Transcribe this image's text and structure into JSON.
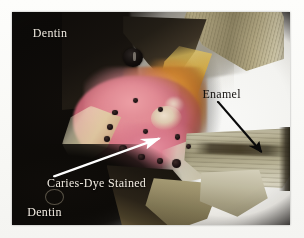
{
  "figure": {
    "kind": "dental-histology-micrograph"
  },
  "labels": {
    "dentin": "Dentin",
    "caries_line1": "Caries-Dye Stained",
    "caries_line2": "Dentin",
    "enamel": "Enamel"
  },
  "annotations": {
    "white_arrow": {
      "name": "caries-dye-stained-dentin-arrow",
      "color": "#ffffff",
      "points_to": "pink stained dentin"
    },
    "black_arrow": {
      "name": "enamel-arrow",
      "color": "#000000",
      "points_to": "enamel slab"
    }
  },
  "colors": {
    "background": "#ffffff",
    "dark_dentin": "#0d0a08",
    "stained_dentin_pink": "#e2858f",
    "carious_amber": "#c4762a",
    "enamel_olive": "#a89d79",
    "enamel_pale": "#cfcab2",
    "label_light": "#f2ece2",
    "label_dark": "#14110e"
  },
  "indent_marks": [
    {
      "x": 36.0,
      "y": 46.0,
      "d": 2.0
    },
    {
      "x": 34.0,
      "y": 52.5,
      "d": 2.4
    },
    {
      "x": 33.0,
      "y": 58.0,
      "d": 2.2
    },
    {
      "x": 38.5,
      "y": 62.5,
      "d": 3.0
    },
    {
      "x": 45.5,
      "y": 66.5,
      "d": 2.2
    },
    {
      "x": 52.0,
      "y": 68.5,
      "d": 2.4
    },
    {
      "x": 57.5,
      "y": 69.0,
      "d": 3.4
    },
    {
      "x": 52.5,
      "y": 44.5,
      "d": 2.0
    },
    {
      "x": 58.5,
      "y": 57.5,
      "d": 2.0
    },
    {
      "x": 62.5,
      "y": 62.0,
      "d": 1.8
    },
    {
      "x": 43.5,
      "y": 40.5,
      "d": 1.8
    },
    {
      "x": 47.0,
      "y": 55.0,
      "d": 1.8
    }
  ]
}
